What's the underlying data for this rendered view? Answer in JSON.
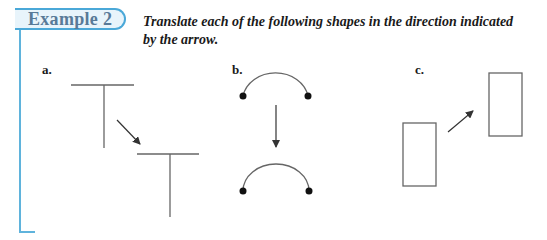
{
  "header": {
    "example_label": "Example 2",
    "instruction_line1": "Translate each of the following shapes in the direction indicated",
    "instruction_line2": "by the arrow."
  },
  "parts": [
    {
      "label": "a.",
      "shape": "T-shape",
      "arrow_direction": "down-right"
    },
    {
      "label": "b.",
      "shape": "arc with endpoint dots",
      "arrow_direction": "down"
    },
    {
      "label": "c.",
      "shape": "rectangle",
      "arrow_direction": "up-right"
    }
  ],
  "colors": {
    "accent_blue": "#4aa8d8",
    "tab_fill": "#e8f4fb",
    "tab_text": "#587a98",
    "shape_stroke": "#666666",
    "arrow": "#333333"
  }
}
